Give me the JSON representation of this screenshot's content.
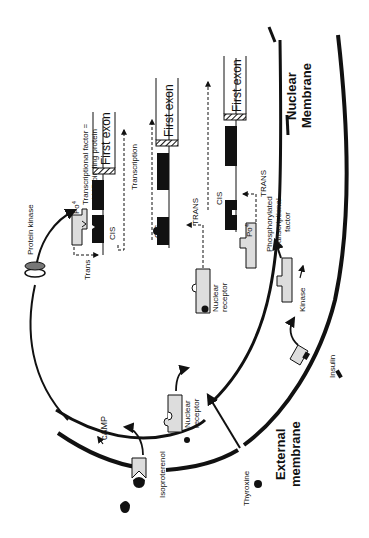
{
  "diagram": {
    "colors": {
      "ink": "#111111",
      "protein_fill": "#d9d9d9",
      "dna_fill": "#111111",
      "background": "#ffffff"
    },
    "labels": {
      "nuclear_membrane_1": "Nuclear",
      "nuclear_membrane_2": "Membrane",
      "external_membrane_1": "External",
      "external_membrane_2": "membrane",
      "protein_kinase": "Protein kinase",
      "camp": "cAMP",
      "isoproterenol": "Isoproterenol",
      "thyroxine": "Thyroxine",
      "insulin": "Insulin",
      "kinase": "Kinase",
      "nuclear_receptor_1a": "Nuclear",
      "nuclear_receptor_1b": "receptor",
      "nuclear_receptor_2a": "Nuclear",
      "nuclear_receptor_2b": "receptor",
      "phospho_1": "Phosphorylated",
      "phospho_2": "transcriptional",
      "phospho_3": "factor",
      "tf_1": "Transcriptional factor =",
      "tf_2": "cAMP binding protein",
      "transcription": "Transcription",
      "trans_lower": "Trans",
      "trans_upper_1": "TRANS",
      "trans_upper_2": "TRANS",
      "cis_1": "CIS",
      "cis_2": "CIS",
      "cis_3": "CIS",
      "po4_1": "Po",
      "po4_2": "Po",
      "sup4": "4",
      "first_exon_1": "First exon",
      "first_exon_2": "First exon",
      "first_exon_3": "First exon"
    }
  }
}
